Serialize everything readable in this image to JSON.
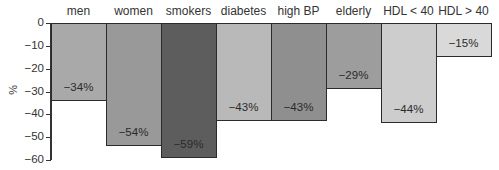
{
  "chart_data": {
    "type": "bar",
    "title": "",
    "xlabel": "",
    "ylabel": "%",
    "ylim": [
      -60,
      0
    ],
    "yticks": [
      0,
      -10,
      -20,
      -30,
      -40,
      -50,
      -60
    ],
    "ytick_labels": [
      "0",
      "−10",
      "−20",
      "−30",
      "−40",
      "−50",
      "−60"
    ],
    "grid": false,
    "legend": null,
    "category_position": "top",
    "categories": [
      "men",
      "women",
      "smokers",
      "diabetes",
      "high BP",
      "elderly",
      "HDL < 40",
      "HDL > 40"
    ],
    "values": [
      -34,
      -54,
      -59,
      -43,
      -43,
      -29,
      -44,
      -15
    ],
    "value_labels": [
      "−34%",
      "−54%",
      "−59%",
      "−43%",
      "−43%",
      "−29%",
      "−44%",
      "−15%"
    ],
    "colors": [
      "#a9a9a9",
      "#999999",
      "#5d5d5d",
      "#b9b9b9",
      "#8f8f8f",
      "#9d9d9d",
      "#cdcdcd",
      "#d9d9d9"
    ]
  }
}
